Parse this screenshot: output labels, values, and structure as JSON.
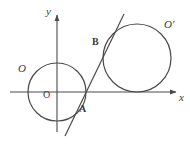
{
  "figure": {
    "type": "plane-geometry-diagram",
    "background_color": "#ffffff",
    "stroke_color": "#4a4a4a",
    "label_color": "#3a3a3a",
    "canvas": {
      "width": 190,
      "height": 147
    },
    "axes": {
      "x_axis": {
        "label": "x",
        "label_style": "italic",
        "from": [
          10,
          92
        ],
        "to": [
          178,
          92
        ],
        "arrow": true,
        "label_pos": [
          180,
          100
        ]
      },
      "y_axis": {
        "label": "y",
        "label_style": "italic",
        "from": [
          57,
          132
        ],
        "to": [
          57,
          13
        ],
        "arrow": true,
        "label_pos": [
          48,
          14
        ]
      },
      "origin": {
        "label": "O",
        "label_style": "upright",
        "pos": [
          57,
          92
        ],
        "label_pos": [
          46,
          103
        ]
      }
    },
    "circles": [
      {
        "name": "circle-O",
        "label": "O",
        "label_style": "italic",
        "center": [
          57,
          92
        ],
        "radius": 29,
        "label_pos": [
          20,
          75
        ]
      },
      {
        "name": "circle-O-prime",
        "label": "O′",
        "label_style": "italic",
        "center": [
          137,
          58
        ],
        "radius": 34,
        "label_pos": [
          166,
          32
        ]
      }
    ],
    "line": {
      "name": "secant-line-AB",
      "from": [
        65,
        136
      ],
      "to": [
        124,
        14
      ]
    },
    "points": [
      {
        "label": "A",
        "pos": [
          79,
          106
        ],
        "label_pos": [
          81,
          116
        ]
      },
      {
        "label": "B",
        "pos": [
          105,
          48
        ],
        "label_pos": [
          94,
          48
        ]
      }
    ]
  }
}
